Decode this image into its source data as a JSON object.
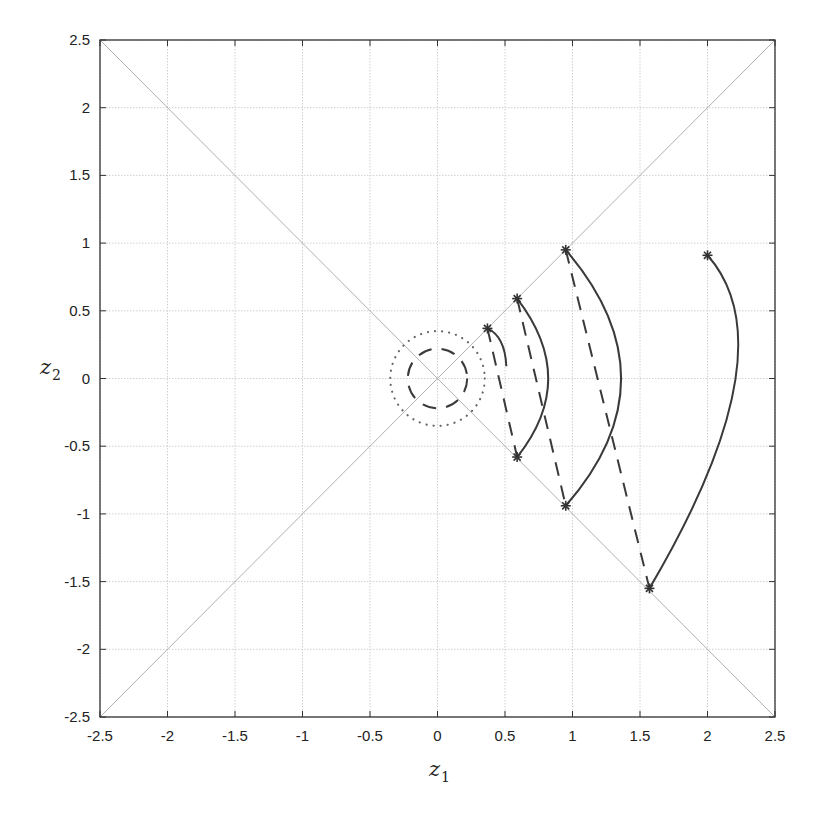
{
  "chart_data": {
    "type": "line",
    "title": "",
    "xlabel": "z_1",
    "ylabel": "z_2",
    "xlim": [
      -2.5,
      2.5
    ],
    "ylim": [
      -2.5,
      2.5
    ],
    "grid": true,
    "xticks": [
      -2.5,
      -2,
      -1.5,
      -1,
      -0.5,
      0,
      0.5,
      1,
      1.5,
      2,
      2.5
    ],
    "yticks": [
      -2.5,
      -2,
      -1.5,
      -1,
      -0.5,
      0,
      0.5,
      1,
      1.5,
      2,
      2.5
    ],
    "xtick_labels": [
      "-2.5",
      "-2",
      "-1.5",
      "-1",
      "-0.5",
      "0",
      "0.5",
      "1",
      "1.5",
      "2",
      "2.5"
    ],
    "ytick_labels": [
      "-2.5",
      "-2",
      "-1.5",
      "-1",
      "-0.5",
      "0",
      "0.5",
      "1",
      "1.5",
      "2",
      "2.5"
    ],
    "reference_lines": [
      {
        "name": "diagonal-y-equals-x",
        "points": [
          [
            -2.5,
            -2.5
          ],
          [
            2.5,
            2.5
          ]
        ],
        "style": "solid-thin-gray"
      },
      {
        "name": "diagonal-y-equals-minus-x",
        "points": [
          [
            -2.5,
            2.5
          ],
          [
            2.5,
            -2.5
          ]
        ],
        "style": "solid-thin-gray"
      }
    ],
    "circles": [
      {
        "name": "dotted-circle",
        "center": [
          0,
          0
        ],
        "radius": 0.35,
        "style": "dotted"
      },
      {
        "name": "dashed-circle",
        "center": [
          0,
          0
        ],
        "radius": 0.22,
        "style": "dashed"
      }
    ],
    "markers": [
      {
        "x": 0.37,
        "y": 0.37
      },
      {
        "x": 0.59,
        "y": 0.59
      },
      {
        "x": 0.95,
        "y": 0.95
      },
      {
        "x": 2.0,
        "y": 0.91
      },
      {
        "x": 0.59,
        "y": -0.58
      },
      {
        "x": 0.95,
        "y": -0.94
      },
      {
        "x": 1.57,
        "y": -1.55
      }
    ],
    "solid_arcs": [
      {
        "from": [
          0.37,
          0.37
        ],
        "via": [
          0.47,
          0.27
        ],
        "to": [
          0.51,
          0.09
        ]
      },
      {
        "from": [
          0.59,
          0.59
        ],
        "via": [
          0.82,
          0.0
        ],
        "to": [
          0.59,
          -0.58
        ]
      },
      {
        "from": [
          0.95,
          0.95
        ],
        "via": [
          1.36,
          0.0
        ],
        "to": [
          0.95,
          -0.94
        ]
      },
      {
        "from": [
          2.0,
          0.91
        ],
        "via": [
          2.2,
          -0.05
        ],
        "to": [
          1.57,
          -1.55
        ]
      }
    ],
    "dashed_segments": [
      {
        "from": [
          0.37,
          0.37
        ],
        "to": [
          0.59,
          -0.58
        ]
      },
      {
        "from": [
          0.59,
          0.59
        ],
        "to": [
          0.95,
          -0.94
        ]
      },
      {
        "from": [
          0.95,
          0.95
        ],
        "to": [
          1.57,
          -1.55
        ]
      }
    ],
    "colors": {
      "axis": "#333333",
      "grid": "#d0d0d0",
      "reference": "#b0b0b0",
      "curve": "#3a3a3a"
    }
  }
}
